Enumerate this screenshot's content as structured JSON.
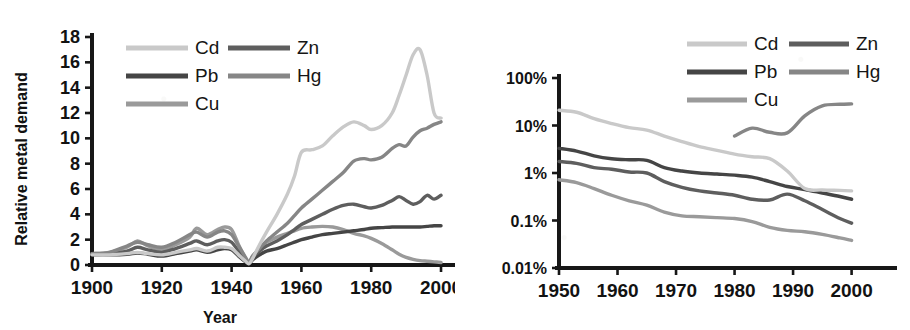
{
  "figure": {
    "background_color": "#ffffff",
    "ink_color": "#171717"
  },
  "series_colors": {
    "Cd": "#c9c9c9",
    "Pb": "#454545",
    "Cu": "#9a9a9a",
    "Zn": "#5e5e5e",
    "Hg": "#868686"
  },
  "legend": {
    "entries": [
      {
        "label": "Cd",
        "color_key": "Cd"
      },
      {
        "label": "Zn",
        "color_key": "Zn"
      },
      {
        "label": "Pb",
        "color_key": "Pb"
      },
      {
        "label": "Hg",
        "color_key": "Hg"
      },
      {
        "label": "Cu",
        "color_key": "Cu"
      }
    ]
  },
  "chart_data": [
    {
      "id": "left",
      "type": "line",
      "title": "",
      "xlabel": "Year",
      "ylabel": "Relative metal demand",
      "xlim": [
        1900,
        2002
      ],
      "ylim": [
        0,
        18
      ],
      "yscale": "linear",
      "grid": false,
      "legend_position": "top-left-inside",
      "xticks": [
        1900,
        1920,
        1940,
        1960,
        1980,
        2000
      ],
      "xtick_labels": [
        "1900",
        "1920",
        "1940",
        "1960",
        "1980",
        "2000"
      ],
      "yticks": [
        0,
        2,
        4,
        6,
        8,
        10,
        12,
        14,
        16,
        18
      ],
      "ytick_labels": [
        "0",
        "2",
        "4",
        "6",
        "8",
        "10",
        "12",
        "14",
        "16",
        "18"
      ],
      "x": [
        1900,
        1905,
        1910,
        1913,
        1916,
        1920,
        1924,
        1928,
        1930,
        1933,
        1936,
        1938,
        1940,
        1942,
        1944,
        1945,
        1946,
        1948,
        1950,
        1953,
        1956,
        1958,
        1960,
        1963,
        1966,
        1969,
        1972,
        1975,
        1978,
        1980,
        1983,
        1986,
        1988,
        1990,
        1992,
        1994,
        1996,
        1998,
        2000
      ],
      "series": [
        {
          "name": "Cd",
          "color_key": "Cd",
          "values": [
            0.8,
            0.8,
            0.9,
            1.0,
            0.9,
            0.8,
            1.0,
            1.2,
            1.3,
            1.1,
            1.4,
            1.4,
            1.3,
            0.8,
            0.3,
            0.1,
            0.5,
            1.6,
            2.6,
            4.0,
            5.6,
            7.0,
            8.9,
            9.1,
            9.4,
            10.2,
            10.9,
            11.3,
            11.0,
            10.7,
            11.0,
            12.0,
            13.4,
            15.0,
            16.6,
            17.0,
            15.0,
            12.0,
            11.6
          ]
        },
        {
          "name": "Hg",
          "color_key": "Hg",
          "values": [
            0.9,
            1.0,
            1.5,
            1.8,
            1.6,
            1.4,
            1.8,
            2.4,
            2.6,
            2.2,
            2.6,
            2.7,
            2.4,
            1.5,
            0.6,
            0.2,
            0.7,
            1.3,
            1.9,
            2.6,
            3.3,
            3.9,
            4.5,
            5.2,
            5.9,
            6.6,
            7.3,
            8.2,
            8.4,
            8.3,
            8.5,
            9.2,
            9.5,
            9.4,
            10.1,
            10.6,
            10.8,
            11.1,
            11.3
          ]
        },
        {
          "name": "Zn",
          "color_key": "Zn",
          "values": [
            0.85,
            0.9,
            1.1,
            1.4,
            1.2,
            1.0,
            1.3,
            1.7,
            1.9,
            1.6,
            1.9,
            2.0,
            1.8,
            1.1,
            0.4,
            0.15,
            0.6,
            1.1,
            1.5,
            1.9,
            2.4,
            2.8,
            3.2,
            3.6,
            4.0,
            4.4,
            4.7,
            4.8,
            4.6,
            4.5,
            4.7,
            5.1,
            5.4,
            5.1,
            4.8,
            5.0,
            5.5,
            5.2,
            5.5
          ]
        },
        {
          "name": "Pb",
          "color_key": "Pb",
          "values": [
            0.8,
            0.8,
            0.85,
            0.95,
            0.85,
            0.7,
            0.9,
            1.1,
            1.2,
            1.0,
            1.2,
            1.3,
            1.2,
            0.7,
            0.25,
            0.1,
            0.4,
            0.8,
            1.1,
            1.3,
            1.6,
            1.8,
            2.0,
            2.2,
            2.4,
            2.5,
            2.6,
            2.7,
            2.8,
            2.9,
            2.95,
            3.0,
            3.0,
            3.0,
            3.0,
            3.0,
            3.05,
            3.1,
            3.1
          ]
        },
        {
          "name": "Cu",
          "color_key": "Cu",
          "values": [
            0.9,
            1.0,
            1.4,
            1.9,
            1.5,
            1.2,
            1.6,
            2.2,
            2.9,
            2.4,
            2.8,
            3.0,
            2.8,
            1.6,
            0.5,
            0.15,
            0.7,
            1.3,
            1.8,
            2.2,
            2.5,
            2.7,
            2.9,
            3.0,
            3.05,
            3.0,
            2.8,
            2.5,
            2.3,
            2.1,
            1.7,
            1.2,
            0.85,
            0.6,
            0.45,
            0.35,
            0.3,
            0.25,
            0.2
          ]
        }
      ]
    },
    {
      "id": "right",
      "type": "line",
      "title": "",
      "xlabel": "",
      "ylabel": "",
      "xlim": [
        1950,
        2004
      ],
      "ylim": [
        0.01,
        100
      ],
      "yscale": "log",
      "yunit": "percent",
      "grid": false,
      "legend_position": "top-right-outside",
      "xticks": [
        1950,
        1960,
        1970,
        1980,
        1990,
        2000
      ],
      "xtick_labels": [
        "1950",
        "1960",
        "1970",
        "1980",
        "1990",
        "2000"
      ],
      "yticks": [
        0.01,
        0.1,
        1,
        10,
        100
      ],
      "ytick_labels": [
        "0.01%",
        "0.1%",
        "1%",
        "10%",
        "100%"
      ],
      "x": [
        1950,
        1953,
        1956,
        1959,
        1962,
        1965,
        1968,
        1971,
        1974,
        1977,
        1980,
        1983,
        1986,
        1989,
        1992,
        1995,
        1998,
        2000
      ],
      "series": [
        {
          "name": "Cd",
          "color_key": "Cd",
          "values": [
            21.0,
            19.0,
            14.0,
            11.0,
            9.0,
            8.0,
            6.0,
            4.6,
            3.6,
            3.0,
            2.5,
            2.2,
            2.0,
            1.1,
            0.47,
            0.44,
            0.43,
            0.42
          ]
        },
        {
          "name": "Pb",
          "color_key": "Pb",
          "values": [
            3.3,
            2.9,
            2.3,
            2.0,
            1.9,
            1.85,
            1.3,
            1.1,
            1.0,
            0.95,
            0.9,
            0.82,
            0.66,
            0.52,
            0.45,
            0.38,
            0.32,
            0.28
          ]
        },
        {
          "name": "Zn",
          "color_key": "Zn",
          "values": [
            1.75,
            1.6,
            1.3,
            1.2,
            1.05,
            1.0,
            0.66,
            0.5,
            0.42,
            0.38,
            0.34,
            0.28,
            0.27,
            0.36,
            0.26,
            0.17,
            0.11,
            0.088
          ]
        },
        {
          "name": "Cu",
          "color_key": "Cu",
          "values": [
            0.72,
            0.63,
            0.47,
            0.34,
            0.26,
            0.21,
            0.15,
            0.125,
            0.12,
            0.115,
            0.11,
            0.095,
            0.072,
            0.062,
            0.058,
            0.051,
            0.043,
            0.038
          ]
        },
        {
          "name": "Hg",
          "color_key": "Hg",
          "start_year": 1980,
          "values": [
            null,
            null,
            null,
            null,
            null,
            null,
            null,
            null,
            null,
            null,
            6.0,
            8.8,
            7.2,
            7.0,
            16.0,
            26.0,
            28.0,
            28.5
          ]
        }
      ]
    }
  ]
}
